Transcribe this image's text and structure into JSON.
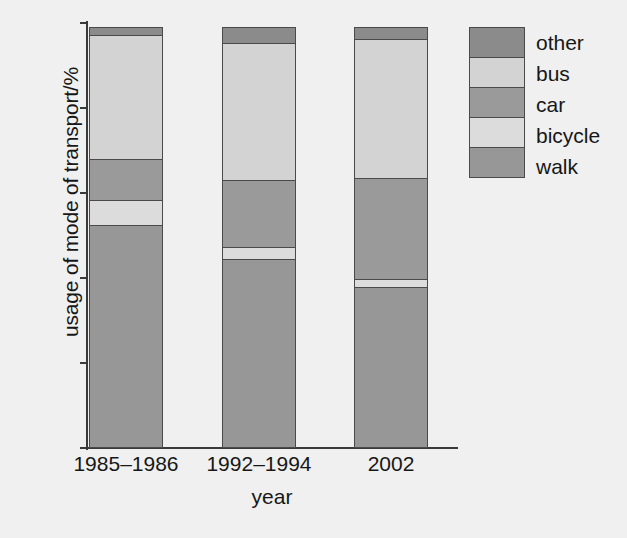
{
  "chart_data": {
    "type": "bar",
    "subtype": "stacked-bar-100",
    "title": "",
    "xlabel": "year",
    "ylabel": "usage of mode of transport/%",
    "categories": [
      "1985–1986",
      "1992–1994",
      "2002"
    ],
    "ylim": [
      0,
      100
    ],
    "yticks": [
      0,
      20,
      40,
      60,
      80,
      100
    ],
    "ytick_labels": [
      "0",
      "20",
      "40",
      "60",
      "80",
      "100"
    ],
    "grid": false,
    "legend_position": "right",
    "stack_order_bottom_to_top": [
      "walk",
      "bicycle",
      "car",
      "bus",
      "other"
    ],
    "series": [
      {
        "name": "walk",
        "color": "#979797",
        "values": [
          52.5,
          44.5,
          38.0
        ]
      },
      {
        "name": "bicycle",
        "color": "#dcdcdc",
        "values": [
          6.0,
          3.0,
          2.0
        ]
      },
      {
        "name": "car",
        "color": "#9a9a9a",
        "values": [
          10.0,
          16.0,
          24.0
        ]
      },
      {
        "name": "bus",
        "color": "#d3d3d3",
        "values": [
          29.5,
          32.5,
          33.0
        ]
      },
      {
        "name": "other",
        "color": "#8b8b8b",
        "values": [
          2.0,
          4.0,
          3.0
        ]
      }
    ],
    "cumulative_boundaries": {
      "1985–1986": [
        0,
        52.5,
        58.5,
        68.5,
        98.0,
        100
      ],
      "1992–1994": [
        0,
        44.5,
        47.5,
        63.5,
        96.0,
        100
      ],
      "2002": [
        0,
        38.0,
        40.0,
        64.0,
        97.0,
        100
      ]
    }
  },
  "legend": {
    "items": [
      {
        "label": "other",
        "color": "#8b8b8b"
      },
      {
        "label": "bus",
        "color": "#d3d3d3"
      },
      {
        "label": "car",
        "color": "#9a9a9a"
      },
      {
        "label": "bicycle",
        "color": "#dcdcdc"
      },
      {
        "label": "walk",
        "color": "#979797"
      }
    ]
  },
  "axes": {
    "y_title": "usage of mode of transport/%",
    "x_title": "year",
    "y_ticks": [
      "100",
      "80",
      "60",
      "40",
      "20",
      "0"
    ],
    "x_ticks": [
      "1985–1986",
      "1992–1994",
      "2002"
    ]
  }
}
